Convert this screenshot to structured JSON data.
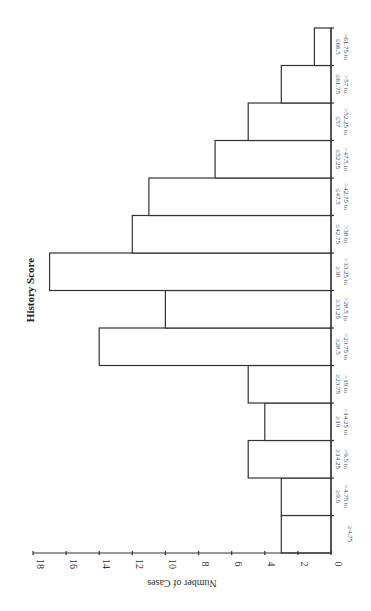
{
  "chart_data": {
    "type": "bar",
    "orientation_note": "figure rendered rotated 90 degrees clockwise",
    "title": "History Score",
    "xlabel": "",
    "ylabel": "Number of Cases",
    "ylim": [
      0,
      18
    ],
    "yticks": [
      0,
      2,
      4,
      6,
      8,
      10,
      12,
      14,
      16,
      18
    ],
    "grid": false,
    "legend": null,
    "categories": [
      [
        "≥4.75"
      ],
      [
        ">4.75 to",
        "≥9.5"
      ],
      [
        ">9.5 to",
        "≥14.25"
      ],
      [
        ">14.25 to",
        "≥19"
      ],
      [
        ">19 to",
        "≥23.75"
      ],
      [
        ">23.75 to",
        "≥28.5"
      ],
      [
        ">28.5 to",
        "≥33.25"
      ],
      [
        ">33.25 to",
        "≥38"
      ],
      [
        ">38 to",
        "≤42.75"
      ],
      [
        ">42.75 to",
        "≤47.5"
      ],
      [
        ">47.5 to",
        "≤52.25"
      ],
      [
        ">52.25 to",
        "≤57"
      ],
      [
        ">57 to",
        "≤61.75"
      ],
      [
        ">61.75 to",
        "≤66.5"
      ]
    ],
    "values": [
      3,
      3,
      5,
      4,
      5,
      14,
      10,
      17,
      12,
      11,
      7,
      5,
      3,
      1
    ]
  }
}
